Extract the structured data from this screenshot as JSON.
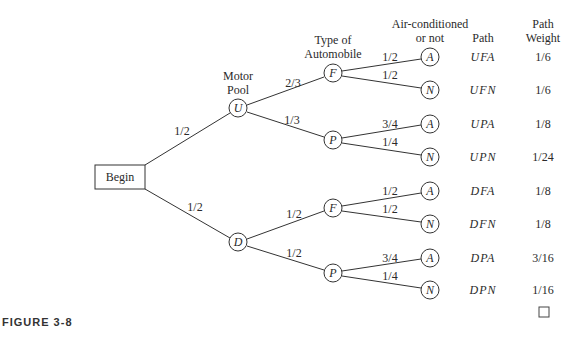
{
  "figure": {
    "caption": "FIGURE 3-8",
    "end_marker": "□"
  },
  "headers": {
    "level1": [
      "Motor",
      "Pool"
    ],
    "level2": [
      "Type of",
      "Automobile"
    ],
    "level3": [
      "Air-conditioned",
      "or not"
    ],
    "path": "Path",
    "weight": [
      "Path",
      "Weight"
    ]
  },
  "root": {
    "label": "Begin"
  },
  "nodes": {
    "U": "U",
    "D": "D",
    "UF": "F",
    "UP": "P",
    "DF": "F",
    "DP": "P",
    "leaves": [
      "A",
      "N",
      "A",
      "N",
      "A",
      "N",
      "A",
      "N"
    ]
  },
  "edges": {
    "begin_U": "1/2",
    "begin_D": "1/2",
    "U_F": "2/3",
    "U_P": "1/3",
    "D_F": "1/2",
    "D_P": "1/2",
    "UF_A": "1/2",
    "UF_N": "1/2",
    "UP_A": "3/4",
    "UP_N": "1/4",
    "DF_A": "1/2",
    "DF_N": "1/2",
    "DP_A": "3/4",
    "DP_N": "1/4"
  },
  "paths": [
    {
      "path": "UFA",
      "weight": "1/6"
    },
    {
      "path": "UFN",
      "weight": "1/6"
    },
    {
      "path": "UPA",
      "weight": "1/8"
    },
    {
      "path": "UPN",
      "weight": "1/24"
    },
    {
      "path": "DFA",
      "weight": "1/8"
    },
    {
      "path": "DFN",
      "weight": "1/8"
    },
    {
      "path": "DPA",
      "weight": "3/16"
    },
    {
      "path": "DPN",
      "weight": "1/16"
    }
  ]
}
